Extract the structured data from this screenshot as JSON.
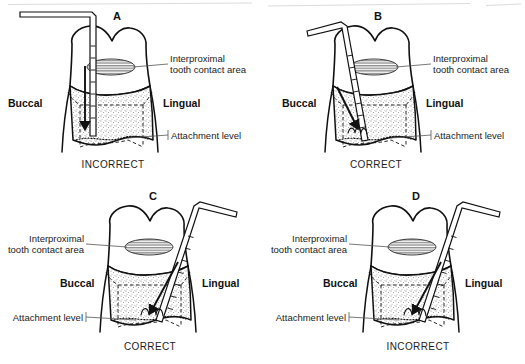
{
  "figure": {
    "background_color": "#ffffff",
    "ink_color": "#111111",
    "stipple_color": "#808080",
    "panel_count": 4
  },
  "shared_labels": {
    "interproximal": "Interproximal\ntooth contact area",
    "interproximal_line1": "Interproximal",
    "interproximal_line2": "tooth contact area",
    "attachment": "Attachment level",
    "buccal": "Buccal",
    "lingual": "Lingual",
    "correct": "CORRECT",
    "incorrect": "INCORRECT"
  },
  "panels": [
    {
      "id": "A",
      "letter": "A",
      "caption": "INCORRECT",
      "probe_orientation": "vertical",
      "probe_side": "buccal",
      "probe_description": "Probe held vertically at the line angle, not angled under the contact area",
      "arrow_direction": "down",
      "labels": {
        "buccal": "Buccal",
        "lingual": "Lingual",
        "interproximal_line1": "Interproximal",
        "interproximal_line2": "tooth contact area",
        "attachment": "Attachment level"
      },
      "callout_side": "right"
    },
    {
      "id": "B",
      "letter": "B",
      "caption": "CORRECT",
      "probe_orientation": "angled-from-buccal",
      "probe_side": "buccal",
      "probe_description": "Probe angled beneath the contact area reaching the deepest attachment level",
      "arrow_direction": "down-right",
      "labels": {
        "buccal": "Buccal",
        "lingual": "Lingual",
        "interproximal_line1": "Interproximal",
        "interproximal_line2": "tooth contact area",
        "attachment": "Attachment level"
      },
      "callout_side": "right"
    },
    {
      "id": "C",
      "letter": "C",
      "caption": "CORRECT",
      "probe_orientation": "angled-from-lingual",
      "probe_side": "lingual",
      "probe_description": "Probe angled from the lingual beneath the contact area to the deepest attachment level",
      "arrow_direction": "down-left",
      "labels": {
        "buccal": "Buccal",
        "lingual": "Lingual",
        "interproximal_line1": "Interproximal",
        "interproximal_line2": "tooth contact area",
        "attachment": "Attachment level"
      },
      "callout_side": "left"
    },
    {
      "id": "D",
      "letter": "D",
      "caption": "INCORRECT",
      "probe_orientation": "steep-from-lingual",
      "probe_side": "lingual",
      "probe_description": "Probe over-angled from the lingual, past the col, giving a false reading",
      "arrow_direction": "down-left",
      "labels": {
        "buccal": "Buccal",
        "lingual": "Lingual",
        "interproximal_line1": "Interproximal",
        "interproximal_line2": "tooth contact area",
        "attachment": "Attachment level"
      },
      "callout_side": "left"
    }
  ]
}
